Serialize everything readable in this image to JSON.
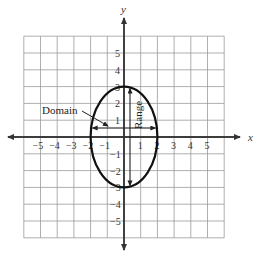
{
  "diagram": {
    "type": "coordinate-plane-ellipse",
    "axes": {
      "x_label": "x",
      "y_label": "y",
      "x_range": [
        -6,
        6
      ],
      "y_range": [
        -6,
        6
      ],
      "x_ticks": [
        "-5",
        "-4",
        "-3",
        "-2",
        "-1",
        "1",
        "2",
        "3",
        "4",
        "5"
      ],
      "y_ticks": [
        "5",
        "4",
        "3",
        "2",
        "1",
        "-1",
        "-2",
        "-3",
        "-4",
        "-5"
      ]
    },
    "ellipse": {
      "center": [
        0,
        0
      ],
      "x_radius": 2,
      "y_radius": 3
    },
    "annotations": {
      "domain_label": "Domain",
      "range_label": "Range",
      "domain_interval": [
        -2,
        2
      ],
      "range_interval": [
        -3,
        3
      ]
    },
    "colors": {
      "grid": "#9a9a9a",
      "axis": "#333333",
      "curve": "#111111"
    }
  }
}
